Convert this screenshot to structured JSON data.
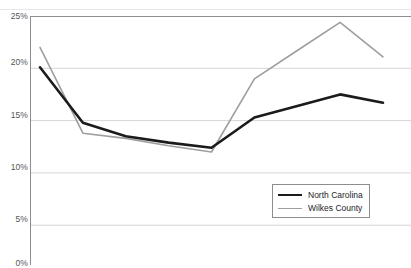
{
  "chart_data": {
    "type": "line",
    "title": "",
    "subtitle": "",
    "xlabel": "",
    "ylabel": "",
    "ylim": [
      0,
      25
    ],
    "y_ticks": [
      25,
      20,
      15,
      10,
      5,
      0
    ],
    "y_tick_labels": [
      "25%",
      "20%",
      "15%",
      "10%",
      "5%",
      "0%"
    ],
    "grid": true,
    "grid_axis": "y",
    "legend_position": "bottom-right",
    "x": [
      1,
      2,
      3,
      4,
      5,
      6,
      7,
      8,
      9
    ],
    "categories": [
      "1",
      "2",
      "3",
      "4",
      "5",
      "6",
      "7",
      "8",
      "9"
    ],
    "series": [
      {
        "name": "North Carolina",
        "color": "#1b1b1b",
        "line_width": 2.6,
        "values": [
          20.1,
          14.8,
          13.5,
          12.9,
          12.4,
          15.3,
          16.4,
          17.5,
          16.7
        ]
      },
      {
        "name": "Wilkes County",
        "color": "#9e9e9e",
        "line_width": 1.6,
        "values": [
          22.0,
          13.8,
          13.3,
          12.6,
          12.0,
          19.0,
          21.7,
          24.4,
          21.1
        ]
      }
    ]
  },
  "legend": {
    "items": [
      {
        "label": "North Carolina"
      },
      {
        "label": "Wilkes County"
      }
    ]
  },
  "axes": {
    "y_labels": [
      "25%",
      "20%",
      "15%",
      "10%",
      "5%",
      "0%"
    ]
  },
  "colors": {
    "series_north_carolina": "#1b1b1b",
    "series_wilkes_county": "#9e9e9e",
    "grid": "#d6d6d8",
    "axis": "#8d8d90",
    "tick_text": "#555558"
  }
}
